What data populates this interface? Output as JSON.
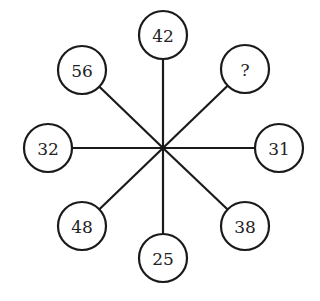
{
  "puzzle": {
    "type": "number-wheel",
    "center": {
      "x": 163,
      "y": 148
    },
    "radius": 24,
    "colors": {
      "line": "#1a1a1a",
      "text": "#222222",
      "background": "#ffffff"
    },
    "nodes": [
      {
        "position": "top",
        "label": "42",
        "x": 163,
        "y": 35
      },
      {
        "position": "top-right",
        "label": "?",
        "x": 245,
        "y": 69
      },
      {
        "position": "right",
        "label": "31",
        "x": 279,
        "y": 148
      },
      {
        "position": "bottom-right",
        "label": "38",
        "x": 245,
        "y": 226
      },
      {
        "position": "bottom",
        "label": "25",
        "x": 163,
        "y": 258
      },
      {
        "position": "bottom-left",
        "label": "48",
        "x": 82,
        "y": 226
      },
      {
        "position": "left",
        "label": "32",
        "x": 48,
        "y": 148
      },
      {
        "position": "top-left",
        "label": "56",
        "x": 82,
        "y": 70
      }
    ]
  }
}
